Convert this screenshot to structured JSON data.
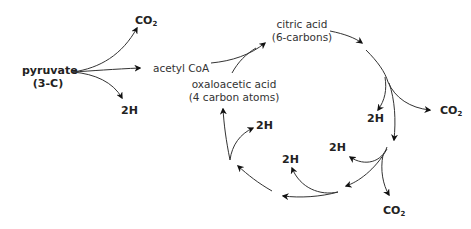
{
  "diagram": {
    "type": "biochemical-cycle",
    "nodes": {
      "pyruvate": {
        "line1": "pyruvate",
        "line2": "(3-C)"
      },
      "acetyl_coa": {
        "label": "acetyl CoA"
      },
      "citric_acid": {
        "line1": "citric acid",
        "line2": "(6-carbons)"
      },
      "oxaloacetic_acid": {
        "line1": "oxaloacetic acid",
        "line2": "(4 carbon atoms)"
      }
    },
    "products": {
      "co2_main": "CO",
      "co2_sub": "2",
      "hydrogen": "2H"
    },
    "edges": [
      {
        "from": "pyruvate",
        "to": "CO2"
      },
      {
        "from": "pyruvate",
        "to": "acetyl CoA"
      },
      {
        "from": "pyruvate",
        "to": "2H"
      },
      {
        "from": "acetyl CoA",
        "to": "citric acid"
      },
      {
        "from": "oxaloacetic acid",
        "to": "citric acid"
      },
      {
        "from": "citric acid",
        "to": "cycle step 1"
      },
      {
        "from": "cycle step 1",
        "to": "2H"
      },
      {
        "from": "cycle step 1",
        "to": "CO2"
      },
      {
        "from": "cycle step 1",
        "to": "cycle step 2"
      },
      {
        "from": "cycle step 2",
        "to": "2H"
      },
      {
        "from": "cycle step 2",
        "to": "CO2"
      },
      {
        "from": "cycle step 2",
        "to": "cycle step 3"
      },
      {
        "from": "cycle step 3",
        "to": "2H"
      },
      {
        "from": "cycle step 3",
        "to": "cycle step 4"
      },
      {
        "from": "cycle step 4",
        "to": "2H"
      },
      {
        "from": "cycle step 4",
        "to": "oxaloacetic acid"
      }
    ],
    "colors": {
      "line": "#222222",
      "text": "#222222",
      "background": "#ffffff"
    }
  }
}
